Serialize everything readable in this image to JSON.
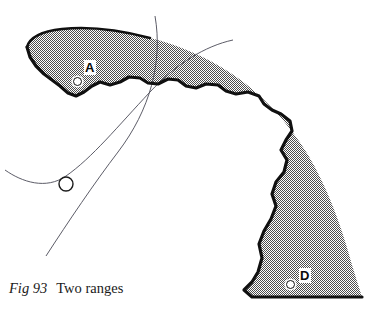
{
  "figure": {
    "caption_label": "Fig 93",
    "caption_text": "Two ranges",
    "width": 378,
    "height": 310,
    "background_color": "#ffffff"
  },
  "map": {
    "shaded_band": {
      "name": "two-ranges-band",
      "fill_color": "#9a9a9a",
      "pattern": "fine-halftone-stipple",
      "outline_color": "#101010",
      "outline_width": 3.2,
      "description": "Crescent shaped shaded range band sweeping from upper left down to lower right"
    },
    "arcs": [
      {
        "id": "arc-1",
        "name": "range-arc-steep",
        "color": "#4a4a56",
        "width": 0.9,
        "start": [
          155,
          16
        ],
        "end": [
          46,
          256
        ],
        "description": "Steep arc descending from top centre to lower left, crossing the band"
      },
      {
        "id": "arc-2",
        "name": "range-arc-shallow",
        "color": "#4a4a56",
        "width": 0.9,
        "start": [
          233,
          40
        ],
        "end": [
          5,
          170
        ],
        "description": "Shallow arc running from upper right to left edge"
      }
    ],
    "points": [
      {
        "id": "A",
        "label": "A",
        "marker_x": 78,
        "marker_y": 82,
        "label_x": 86,
        "label_y": 66,
        "marker_type": "small-circle",
        "marker_fill": "#ffffff"
      },
      {
        "id": "D",
        "label": "D",
        "marker_x": 291,
        "marker_y": 285,
        "label_x": 300,
        "label_y": 274,
        "marker_type": "small-circle",
        "marker_fill": "#ffffff"
      },
      {
        "id": "FIX",
        "label": "",
        "marker_x": 66,
        "marker_y": 184,
        "label_x": 0,
        "label_y": 0,
        "marker_type": "fix-circle",
        "marker_fill": "none"
      }
    ]
  }
}
